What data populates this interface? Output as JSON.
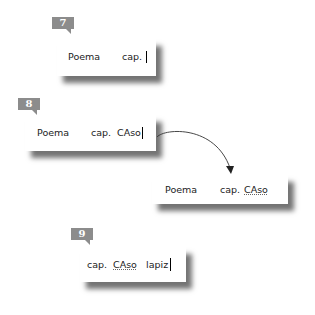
{
  "steps": [
    {
      "badge": "7",
      "words": [
        "Poema",
        "cap."
      ]
    },
    {
      "badge": "8",
      "words": [
        "Poema",
        "cap.",
        "CAso"
      ]
    },
    {
      "badge": "",
      "words": [
        "Poema",
        "cap.",
        "CAso"
      ],
      "underlined": "CAso"
    },
    {
      "badge": "9",
      "words": [
        "cap.",
        "CAso",
        "lapiz"
      ],
      "underlined": "CAso"
    }
  ],
  "colors": {
    "badge": "#8c8c8c",
    "text": "#222222",
    "arrow": "#333333"
  }
}
